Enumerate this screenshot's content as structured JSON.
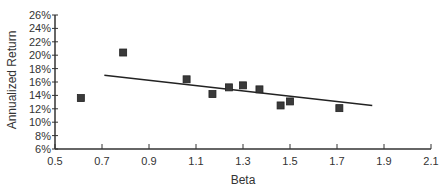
{
  "chart_data": {
    "type": "scatter",
    "title": "",
    "xlabel": "Beta",
    "ylabel": "Annualized Return",
    "xlim": [
      0.5,
      2.1
    ],
    "ylim": [
      6,
      26
    ],
    "x_ticks": [
      0.5,
      0.7,
      0.9,
      1.1,
      1.3,
      1.5,
      1.7,
      1.9,
      2.1
    ],
    "x_tick_labels": [
      "0.5",
      "0.7",
      "0.9",
      "1.1",
      "1.3",
      "1.5",
      "1.7",
      "1.9",
      "2.1"
    ],
    "y_ticks": [
      6,
      8,
      10,
      12,
      14,
      16,
      18,
      20,
      22,
      24,
      26
    ],
    "y_tick_labels": [
      "6%",
      "8%",
      "10%",
      "12%",
      "14%",
      "16%",
      "18%",
      "20%",
      "22%",
      "24%",
      "26%"
    ],
    "grid": false,
    "legend": null,
    "series": [
      {
        "name": "Funds",
        "marker": "square",
        "color": "#333333",
        "points": [
          {
            "x": 0.61,
            "y": 13.6
          },
          {
            "x": 0.79,
            "y": 20.4
          },
          {
            "x": 1.06,
            "y": 16.4
          },
          {
            "x": 1.17,
            "y": 14.2
          },
          {
            "x": 1.24,
            "y": 15.2
          },
          {
            "x": 1.3,
            "y": 15.5
          },
          {
            "x": 1.37,
            "y": 14.9
          },
          {
            "x": 1.46,
            "y": 12.5
          },
          {
            "x": 1.5,
            "y": 13.1
          },
          {
            "x": 1.71,
            "y": 12.1
          }
        ]
      }
    ],
    "trendline": {
      "type": "linear",
      "color": "#222222",
      "start": {
        "x": 0.71,
        "y": 17.0
      },
      "end": {
        "x": 1.85,
        "y": 12.5
      }
    }
  },
  "colors": {
    "axis": "#333333",
    "marker_fill": "#3a3a3a",
    "marker_stroke": "#222222",
    "background": "#ffffff"
  }
}
